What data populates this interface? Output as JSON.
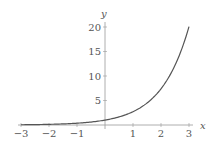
{
  "chart_data": {
    "type": "line",
    "title": "",
    "function": "y = e^x",
    "xlabel": "x",
    "ylabel": "y",
    "xlim": [
      -3,
      3
    ],
    "ylim": [
      0,
      20
    ],
    "x_ticks": [
      -3,
      -2,
      -1,
      1,
      2,
      3
    ],
    "x_tick_labels": [
      "−3",
      "−2",
      "−1",
      "1",
      "2",
      "3"
    ],
    "y_ticks": [
      5,
      10,
      15,
      20
    ],
    "y_tick_labels": [
      "5",
      "10",
      "15",
      "20"
    ],
    "grid": false,
    "legend": null,
    "series": [
      {
        "name": "e^x",
        "x": [
          -3,
          -2.5,
          -2,
          -1.5,
          -1,
          -0.5,
          0,
          0.5,
          1,
          1.5,
          2,
          2.5,
          3
        ],
        "values": [
          0.05,
          0.08,
          0.14,
          0.22,
          0.37,
          0.61,
          1.0,
          1.65,
          2.72,
          4.48,
          7.39,
          12.18,
          20.09
        ]
      }
    ],
    "colors": {
      "curve": "#555555",
      "axes": "#888888"
    }
  }
}
